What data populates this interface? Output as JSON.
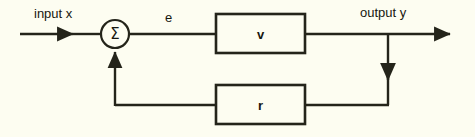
{
  "diagram": {
    "kind": "feedback-control-block-diagram",
    "background_color": "#fdfdf1",
    "line_color": "#24241a",
    "text_color": "#17170f",
    "signals": {
      "input_label": "input x",
      "error_label": "e",
      "output_label": "output y"
    },
    "summing_junction": {
      "symbol": "Σ",
      "name": "summing-junction"
    },
    "blocks": [
      {
        "id": "forward",
        "label": "v"
      },
      {
        "id": "feedback",
        "label": "r"
      }
    ]
  }
}
